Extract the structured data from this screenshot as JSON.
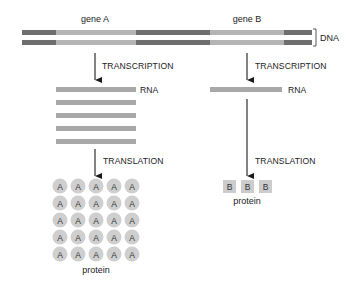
{
  "colors": {
    "dna_dark": "#6e6e6e",
    "dna_light": "#b4b4b4",
    "rna": "#a8a8a8",
    "protein_a": "#cfcfcf",
    "protein_b": "#cccccc",
    "arrow": "#1a1a1a"
  },
  "dna": {
    "label": "DNA",
    "gene_a_label": "gene A",
    "gene_b_label": "gene B"
  },
  "gene_a": {
    "transcription_label": "TRANSCRIPTION",
    "rna_label": "RNA",
    "rna_copies": 5,
    "translation_label": "TRANSLATION",
    "protein_glyph": "A",
    "protein_grid": {
      "rows": 5,
      "cols": 5
    },
    "protein_label": "protein"
  },
  "gene_b": {
    "transcription_label": "TRANSCRIPTION",
    "rna_label": "RNA",
    "rna_copies": 1,
    "translation_label": "TRANSLATION",
    "protein_glyph": "B",
    "protein_count": 3,
    "protein_label": "protein"
  }
}
